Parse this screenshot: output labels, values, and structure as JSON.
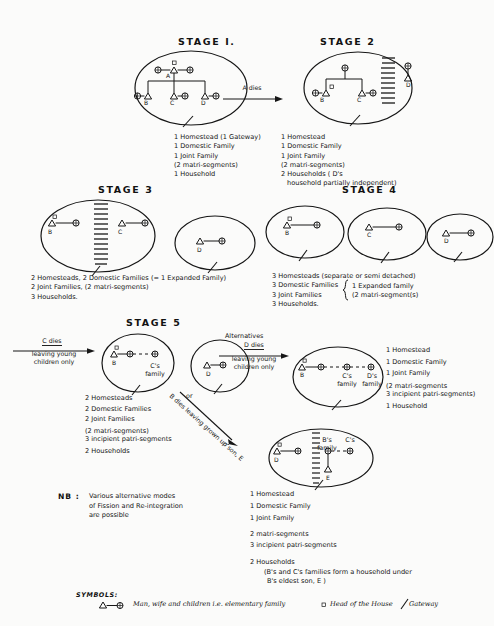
{
  "stages": {
    "stage1": {
      "title": "STAGE I.",
      "nodes": [
        "A",
        "B",
        "C",
        "D"
      ],
      "list": [
        "1 Homestead (1 Gateway)",
        "1 Domestic Family",
        "1 Joint Family",
        "(2 matri-segments)",
        "1 Household"
      ]
    },
    "stage2": {
      "title": "STAGE 2",
      "nodes": [
        "B",
        "C",
        "D"
      ],
      "list": [
        "1 Homestead",
        "1 Domestic Family",
        "1 Joint Family",
        "(2 matri-segments)",
        "2 Households ( D's",
        "household partially independent)"
      ]
    },
    "stage3": {
      "title": "STAGE 3",
      "nodes": [
        "B",
        "C",
        "D"
      ],
      "list": [
        "2 Homesteads, 2 Domestic Families (= 1 Expanded Family)",
        "2 Joint Families, (2 matri-segments)",
        "3 Households."
      ]
    },
    "stage4": {
      "title": "STAGE 4",
      "nodes": [
        "B",
        "C",
        "D"
      ],
      "list": [
        "3 Homesteads (separate or semi detached)",
        "3 Domestic Families",
        "3 Joint Families",
        "3 Households."
      ],
      "brace_note_line1": "1 Expanded family",
      "brace_note_line2": "(2 matri-segment(s)"
    },
    "stage5": {
      "title": "STAGE  5",
      "alternatives_label": "Alternatives",
      "or_label": "or",
      "arrow_c_dies": {
        "line1": "C dies",
        "line2": "leaving young",
        "line3": "children only"
      },
      "arrow_d_dies": {
        "line1": "D dies",
        "line2": "leaving young",
        "line3": "children only"
      },
      "arrow_b_dies_diagonal": "B dies leaving grown up son, E",
      "left_group": {
        "nodes": [
          "B",
          "D"
        ],
        "inner_label_line1": "C's",
        "inner_label_line2": "family",
        "list": [
          "2  Homesteads",
          "2  Domestic Families",
          "2  Joint Families",
          "(2  matri-segments)",
          "3  incipient patri-segments",
          "2  Households"
        ]
      },
      "alt_a": {
        "nodes": [
          "B"
        ],
        "inner_label_c_line1": "C's",
        "inner_label_c_line2": "family",
        "inner_label_d_line1": "D's",
        "inner_label_d_line2": "family",
        "list": [
          "1  Homestead",
          "1  Domestic Family",
          "1  Joint Family",
          "(2  matri-segments",
          "3  incipient patri-segments)",
          "1  Household"
        ]
      },
      "alt_b": {
        "nodes": [
          "D",
          "E"
        ],
        "inner_label_b_line1": "B's",
        "inner_label_b_line2": "family",
        "inner_label_c": "C's",
        "list": [
          "1    Homestead",
          "1    Domestic Family",
          "1    Joint Family",
          "2    matri-segments",
          "3    incipient patri-segments",
          "2    Households"
        ],
        "list_footnote_line1": "(B's and C's families form a household under",
        "list_footnote_line2": "B's eldest son, E )"
      }
    }
  },
  "nb": {
    "label": "NB :",
    "lines": [
      "Various alternative modes",
      "of Fission and Re-integration",
      "are possible"
    ]
  },
  "symbols": {
    "heading": "SYMBOLS:",
    "elementary_family": "Man, wife and children i.e. elementary family",
    "head_of_house": "Head of the House",
    "gateway": "Gateway"
  },
  "icons": {
    "triangle": "triangle-male-icon",
    "circle": "circle-female-icon",
    "square": "square-head-of-house-icon",
    "slash": "slash-gateway-icon",
    "arrow": "arrow-icon",
    "dashed_fence": "dashed-partition-icon"
  },
  "colors": {
    "ink": "#161616",
    "paper": "#fbfbfa"
  }
}
